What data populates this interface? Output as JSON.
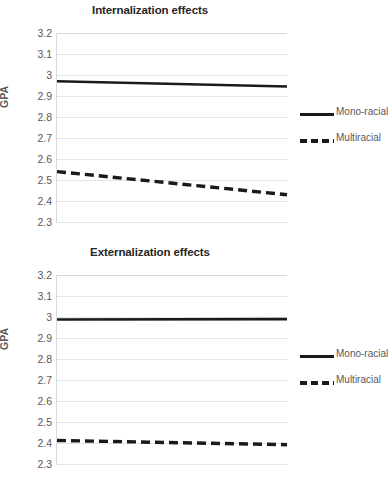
{
  "figure": {
    "background": "#ffffff",
    "text_color": "#595959",
    "title_color": "#262626",
    "grid_color": "#e6e6e6",
    "series_color": "#1a1a1a"
  },
  "charts": [
    {
      "id": "internalization",
      "title": "Internalization effects",
      "ylabel": "GPA",
      "yticks": [
        "3.2",
        "3.1",
        "3",
        "2.9",
        "2.8",
        "2.7",
        "2.6",
        "2.5",
        "2.4",
        "2.3"
      ],
      "legend": [
        {
          "label": "Mono-racial",
          "style": "solid"
        },
        {
          "label": "Multiracial",
          "style": "dashed"
        }
      ]
    },
    {
      "id": "externalization",
      "title": "Externalization effects",
      "ylabel": "GPA",
      "yticks": [
        "3.2",
        "3.1",
        "3",
        "2.9",
        "2.8",
        "2.7",
        "2.6",
        "2.5",
        "2.4",
        "2.3"
      ],
      "legend": [
        {
          "label": "Mono-racial",
          "style": "solid"
        },
        {
          "label": "Multiracial",
          "style": "dashed"
        }
      ]
    }
  ],
  "chart_data": [
    {
      "type": "line",
      "title": "Internalization effects",
      "xlabel": "",
      "ylabel": "GPA",
      "ylim": [
        2.3,
        3.2
      ],
      "ytick_step": 0.1,
      "grid": true,
      "legend_position": "right",
      "x": [
        0,
        1
      ],
      "xtick_labels": [],
      "series": [
        {
          "name": "Mono-racial",
          "style": "solid",
          "values": [
            2.97,
            2.945
          ]
        },
        {
          "name": "Multiracial",
          "style": "dashed",
          "values": [
            2.54,
            2.43
          ]
        }
      ]
    },
    {
      "type": "line",
      "title": "Externalization effects",
      "xlabel": "",
      "ylabel": "GPA",
      "ylim": [
        2.3,
        3.2
      ],
      "ytick_step": 0.1,
      "grid": true,
      "legend_position": "right",
      "x": [
        0,
        1
      ],
      "xtick_labels": [],
      "series": [
        {
          "name": "Mono-racial",
          "style": "solid",
          "values": [
            2.988,
            2.99
          ]
        },
        {
          "name": "Multiracial",
          "style": "dashed",
          "values": [
            2.412,
            2.392
          ]
        }
      ]
    }
  ]
}
